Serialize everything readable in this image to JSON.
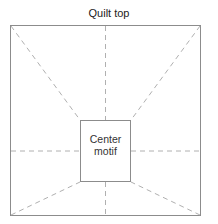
{
  "diagram": {
    "title": "Quilt top",
    "center_label_line1": "Center",
    "center_label_line2": "motif",
    "colors": {
      "outline": "#888888",
      "dashes": "#aaaaaa",
      "text": "#222222"
    }
  }
}
